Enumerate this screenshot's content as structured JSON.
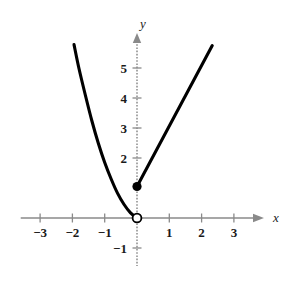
{
  "figure": {
    "background_color": "#ffffff",
    "curve_color": "#000000",
    "axis_color": "#8a8a8a",
    "text_color": "#1a1a1a"
  },
  "axes": {
    "x_axis_label": "x",
    "y_axis_label": "y",
    "x_ticks": [
      {
        "value": -3,
        "label": "−3"
      },
      {
        "value": -2,
        "label": "−2"
      },
      {
        "value": -1,
        "label": "−1"
      },
      {
        "value": 1,
        "label": "1"
      },
      {
        "value": 2,
        "label": "2"
      },
      {
        "value": 3,
        "label": "3"
      }
    ],
    "y_ticks": [
      {
        "value": -1,
        "label": "−1"
      },
      {
        "value": 2,
        "label": "2"
      },
      {
        "value": 3,
        "label": "3"
      },
      {
        "value": 4,
        "label": "4"
      },
      {
        "value": 5,
        "label": "5"
      }
    ]
  },
  "chart_data": {
    "type": "line",
    "title": "",
    "xlabel": "x",
    "ylabel": "y",
    "xlim": [
      -3.6,
      3.9
    ],
    "ylim": [
      -1.6,
      6.2
    ],
    "grid": false,
    "legend": "none",
    "x_tick_values": [
      -3,
      -2,
      -1,
      1,
      2,
      3
    ],
    "y_tick_values": [
      -1,
      2,
      3,
      4,
      5
    ],
    "series": [
      {
        "name": "left-branch-parabola",
        "style": "curve",
        "points": [
          {
            "x": -1.95,
            "y": 5.78
          },
          {
            "x": -1.8,
            "y": 5.0
          },
          {
            "x": -1.6,
            "y": 4.1
          },
          {
            "x": -1.4,
            "y": 3.25
          },
          {
            "x": -1.2,
            "y": 2.5
          },
          {
            "x": -1.0,
            "y": 1.85
          },
          {
            "x": -0.8,
            "y": 1.3
          },
          {
            "x": -0.6,
            "y": 0.82
          },
          {
            "x": -0.4,
            "y": 0.45
          },
          {
            "x": -0.2,
            "y": 0.17
          },
          {
            "x": 0.0,
            "y": 0.0
          }
        ]
      },
      {
        "name": "right-branch-line",
        "style": "straight",
        "points": [
          {
            "x": 0.0,
            "y": 1.05
          },
          {
            "x": 2.33,
            "y": 5.75
          }
        ]
      }
    ],
    "markers": [
      {
        "name": "open-endpoint",
        "x": 0,
        "y": 0,
        "fill": "open"
      },
      {
        "name": "closed-endpoint",
        "x": 0,
        "y": 1.05,
        "fill": "closed"
      }
    ]
  }
}
